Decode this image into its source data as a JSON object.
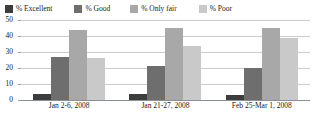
{
  "chart_data": {
    "type": "bar",
    "title": "",
    "subtitle": "",
    "xlabel": "",
    "ylabel": "",
    "ylim": [
      0,
      50
    ],
    "yticks": [
      "0",
      "10",
      "20",
      "30",
      "40",
      "50"
    ],
    "grid": true,
    "legend_position": "top",
    "categories": [
      "Jan 2-6, 2008",
      "Jan 21-27, 2008",
      "Feb 25-Mar 1, 2008"
    ],
    "series": [
      {
        "name": "% Excellent",
        "color": "#3d3d3d",
        "values": [
          4,
          4,
          3
        ]
      },
      {
        "name": "% Good",
        "color": "#6e6e6e",
        "values": [
          27,
          21,
          20
        ]
      },
      {
        "name": "% Only fair",
        "color": "#a8a8a8",
        "values": [
          44,
          45,
          45
        ]
      },
      {
        "name": "% Poor",
        "color": "#c9c9c9",
        "values": [
          26,
          34,
          39
        ]
      }
    ]
  },
  "legend": {
    "items": [
      {
        "label": "% Excellent",
        "color": "#3d3d3d"
      },
      {
        "label": "% Good",
        "color": "#6e6e6e"
      },
      {
        "label": "% Only fair",
        "color": "#a8a8a8"
      },
      {
        "label": "% Poor",
        "color": "#c9c9c9"
      }
    ]
  },
  "axes": {
    "y_ticks": [
      "50",
      "40",
      "30",
      "20",
      "10",
      "0"
    ],
    "x_ticks": [
      "Jan 2-6, 2008",
      "Jan 21-27, 2008",
      "Feb 25-Mar 1, 2008"
    ]
  },
  "colors": {
    "gridline": "#c8ccd0",
    "baseline": "#8a8f94",
    "text": "#1a1a1a",
    "background": "#ffffff"
  }
}
